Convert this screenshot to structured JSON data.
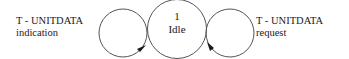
{
  "diagram": {
    "type": "state-transition",
    "state": {
      "number": "1",
      "name": "Idle"
    },
    "transitions": [
      {
        "label_line1": "T -  UNITDATA",
        "label_line2": "indication",
        "kind": "self-loop",
        "side": "left"
      },
      {
        "label_line1": "T -  UNITDATA",
        "label_line2": "request",
        "kind": "self-loop",
        "side": "right"
      }
    ],
    "colors": {
      "stroke": "#3a3a3a",
      "text": "#1a1a1a",
      "background": "#ffffff"
    }
  }
}
